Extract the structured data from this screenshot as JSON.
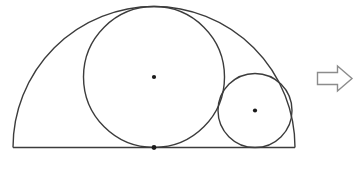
{
  "diagram": {
    "colors": {
      "line": "#3c3c3c",
      "dot": "#1a1a1a",
      "arrow": "#8c8c8c",
      "background": "#ffffff"
    },
    "canvas": {
      "width": 359,
      "height": 175
    },
    "semicircle": {
      "path": "M 13 147.5 A 141 141 0 0 1 295 147.5",
      "cx": 154,
      "cy": 147.5,
      "r": 141
    },
    "baseline": {
      "x1": 13,
      "y1": 147.5,
      "x2": 295,
      "y2": 147.5
    },
    "large_circle": {
      "cx": 154,
      "cy": 77,
      "r": 70.5
    },
    "small_circle": {
      "cx": 255,
      "cy": 110.5,
      "r": 37
    },
    "dots": {
      "large_center": {
        "cx": 154,
        "cy": 77,
        "r": 2.1
      },
      "small_center": {
        "cx": 255,
        "cy": 110.5,
        "r": 2.1
      },
      "base_tangent": {
        "cx": 154,
        "cy": 147.5,
        "r": 2.4
      }
    },
    "arrow": {
      "points": "317.5,72.5 337.5,72.5 337.5,66 352,78.5 337.5,91 337.5,84.5 317.5,84.5"
    }
  }
}
